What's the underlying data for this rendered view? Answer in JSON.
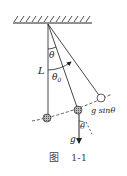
{
  "figure": {
    "caption_prefix": "图",
    "caption_number": "1-1",
    "labels": {
      "theta": "θ",
      "theta0": "θ",
      "theta0_sub": "0",
      "length": "L",
      "g_sin": "g sinθ",
      "g": "g",
      "theta_bottom": "θ"
    }
  }
}
